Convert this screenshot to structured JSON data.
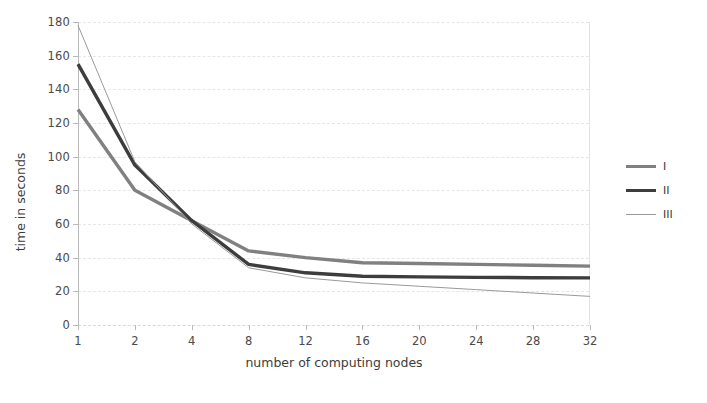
{
  "chart_data": {
    "type": "line",
    "title": "",
    "xlabel": "number of computing nodes",
    "ylabel": "time in seconds",
    "categories": [
      "1",
      "2",
      "4",
      "8",
      "12",
      "16",
      "20",
      "24",
      "28",
      "32"
    ],
    "x_tick_labels": [
      "1",
      "2",
      "4",
      "8",
      "12",
      "16",
      "20",
      "24",
      "28",
      "32"
    ],
    "y_tick_labels": [
      "0",
      "20",
      "40",
      "60",
      "80",
      "100",
      "120",
      "140",
      "160",
      "180"
    ],
    "y_ticks": [
      0,
      20,
      40,
      60,
      80,
      100,
      120,
      140,
      160,
      180
    ],
    "ylim": [
      0,
      180
    ],
    "grid": "horizontal",
    "legend_position": "right-outside",
    "series": [
      {
        "name": "I",
        "color": "#808080",
        "width": 3.4,
        "values": [
          128,
          80,
          62,
          44,
          40,
          37,
          36.5,
          36,
          35.5,
          35
        ]
      },
      {
        "name": "II",
        "color": "#3d3d3d",
        "width": 3.4,
        "values": [
          155,
          95,
          62,
          36,
          31,
          29,
          28.6,
          28.3,
          28.1,
          28
        ]
      },
      {
        "name": "III",
        "color": "#9a9a9a",
        "width": 1,
        "values": [
          178,
          97,
          60,
          34,
          28,
          25,
          23,
          21,
          19,
          17
        ]
      }
    ]
  }
}
